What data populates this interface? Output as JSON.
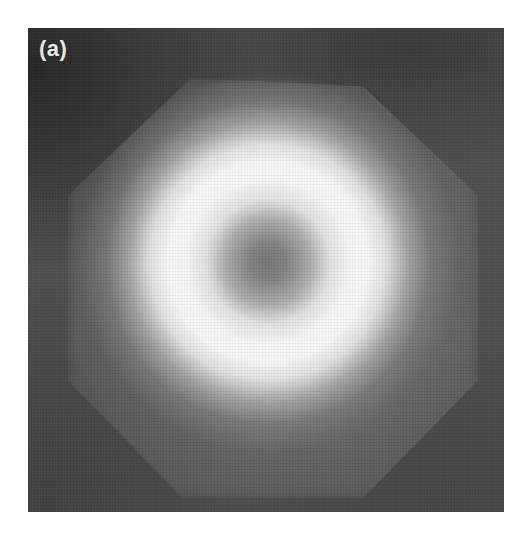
{
  "figure": {
    "panel_label": "(a)",
    "colors": {
      "page_background": "#ffffff",
      "image_background": "#4d4d4d",
      "dark_corners": "#363636",
      "halo": "#6e6e6e",
      "ring_peak": "#f4f4f4",
      "core": "#727272",
      "label": "#e6e6e6"
    }
  }
}
